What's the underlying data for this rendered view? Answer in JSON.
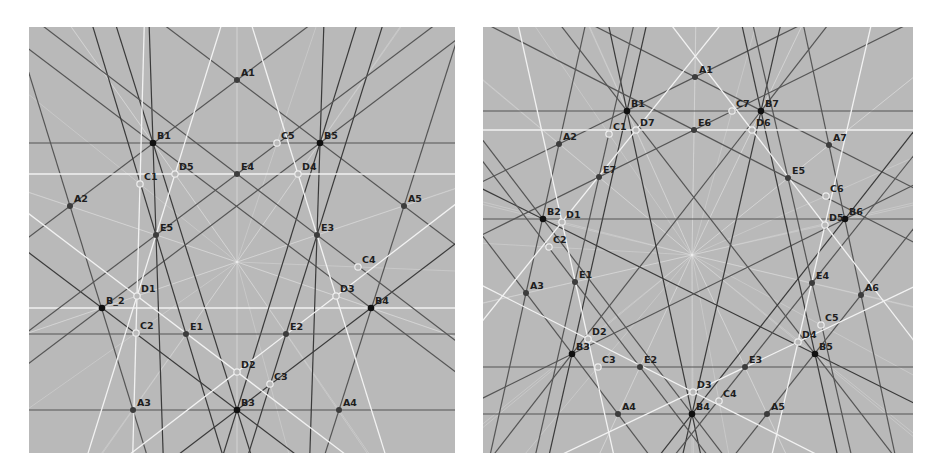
{
  "colors": {
    "background": "#b9b9b9",
    "dark_line": "#3a3a3a",
    "mid_line": "#555555",
    "white_line": "#f2f2f2",
    "filled_point": "#3c3c3c",
    "black_point": "#101010",
    "hollow_point_stroke": "#eeeeee",
    "label": "#1e1e1e"
  },
  "left_diagram": {
    "name": "pentagon-construction",
    "origin": [
      29,
      27
    ],
    "center": [
      237,
      262
    ],
    "points": [
      {
        "label": "A1",
        "x": 237,
        "y": 80,
        "style": "filled"
      },
      {
        "label": "A2",
        "x": 70,
        "y": 206,
        "style": "filled"
      },
      {
        "label": "A3",
        "x": 133,
        "y": 410,
        "style": "filled"
      },
      {
        "label": "A4",
        "x": 339,
        "y": 410,
        "style": "filled"
      },
      {
        "label": "A5",
        "x": 404,
        "y": 206,
        "style": "filled"
      },
      {
        "label": "B1",
        "x": 153,
        "y": 143,
        "style": "black"
      },
      {
        "label": "B_2",
        "x": 102,
        "y": 308,
        "style": "black"
      },
      {
        "label": "B3",
        "x": 237,
        "y": 410,
        "style": "black"
      },
      {
        "label": "B4",
        "x": 371,
        "y": 308,
        "style": "black"
      },
      {
        "label": "B5",
        "x": 320,
        "y": 143,
        "style": "black"
      },
      {
        "label": "C1",
        "x": 140,
        "y": 184,
        "style": "hollow"
      },
      {
        "label": "C2",
        "x": 136,
        "y": 333,
        "style": "hollow"
      },
      {
        "label": "C3",
        "x": 270,
        "y": 384,
        "style": "hollow"
      },
      {
        "label": "C4",
        "x": 358,
        "y": 267,
        "style": "hollow"
      },
      {
        "label": "C5",
        "x": 277,
        "y": 143,
        "style": "hollow"
      },
      {
        "label": "D1",
        "x": 137,
        "y": 296,
        "style": "hollow"
      },
      {
        "label": "D2",
        "x": 237,
        "y": 372,
        "style": "hollow"
      },
      {
        "label": "D3",
        "x": 336,
        "y": 296,
        "style": "hollow"
      },
      {
        "label": "D4",
        "x": 298,
        "y": 174,
        "style": "hollow"
      },
      {
        "label": "D5",
        "x": 175,
        "y": 174,
        "style": "hollow"
      },
      {
        "label": "E1",
        "x": 186,
        "y": 334,
        "style": "filled"
      },
      {
        "label": "E2",
        "x": 286,
        "y": 334,
        "style": "filled"
      },
      {
        "label": "E3",
        "x": 317,
        "y": 235,
        "style": "filled"
      },
      {
        "label": "E4",
        "x": 237,
        "y": 174,
        "style": "filled"
      },
      {
        "label": "E5",
        "x": 156,
        "y": 235,
        "style": "filled"
      }
    ],
    "lines": [
      {
        "through": [
          "A1",
          "A2"
        ],
        "kind": "mid"
      },
      {
        "through": [
          "A2",
          "A3"
        ],
        "kind": "mid"
      },
      {
        "through": [
          "A3",
          "A4"
        ],
        "kind": "mid"
      },
      {
        "through": [
          "A4",
          "A5"
        ],
        "kind": "mid"
      },
      {
        "through": [
          "A5",
          "A1"
        ],
        "kind": "mid"
      },
      {
        "through": [
          "B1",
          "B5"
        ],
        "kind": "mid"
      },
      {
        "through": [
          "B1",
          "B3"
        ],
        "kind": "dark"
      },
      {
        "through": [
          "B_2",
          "B4"
        ],
        "kind": "white"
      },
      {
        "through": [
          "B3",
          "B5"
        ],
        "kind": "dark"
      },
      {
        "through": [
          "B_2",
          "B3"
        ],
        "kind": "dark"
      },
      {
        "through": [
          "B4",
          "B3"
        ],
        "kind": "dark"
      },
      {
        "through": [
          "B1",
          "B4"
        ],
        "kind": "mid"
      },
      {
        "through": [
          "B5",
          "B_2"
        ],
        "kind": "mid"
      },
      {
        "through": [
          "B1",
          "E5"
        ],
        "kind": "dark"
      },
      {
        "through": [
          "B5",
          "E3"
        ],
        "kind": "dark"
      },
      {
        "through": [
          "E5",
          "E1"
        ],
        "kind": "dark"
      },
      {
        "through": [
          "E3",
          "E2"
        ],
        "kind": "dark"
      },
      {
        "through": [
          "E1",
          "E2"
        ],
        "kind": "mid"
      },
      {
        "through": [
          "E4",
          "E5"
        ],
        "kind": "mid"
      },
      {
        "through": [
          "E4",
          "E3"
        ],
        "kind": "mid"
      },
      {
        "through": [
          "D5",
          "D4"
        ],
        "kind": "white"
      },
      {
        "through": [
          "D5",
          "D1"
        ],
        "kind": "white"
      },
      {
        "through": [
          "D4",
          "D3"
        ],
        "kind": "white"
      },
      {
        "through": [
          "D1",
          "D2"
        ],
        "kind": "white"
      },
      {
        "through": [
          "D3",
          "D2"
        ],
        "kind": "white"
      },
      {
        "through": [
          "C1",
          "C2"
        ],
        "kind": "white"
      }
    ]
  },
  "right_diagram": {
    "name": "heptagon-construction",
    "origin": [
      483,
      27
    ],
    "center": [
      692,
      255
    ],
    "points": [
      {
        "label": "A1",
        "x": 695,
        "y": 77,
        "style": "filled"
      },
      {
        "label": "A2",
        "x": 559,
        "y": 144,
        "style": "filled"
      },
      {
        "label": "A3",
        "x": 526,
        "y": 293,
        "style": "filled"
      },
      {
        "label": "A4",
        "x": 618,
        "y": 414,
        "style": "filled"
      },
      {
        "label": "A5",
        "x": 767,
        "y": 414,
        "style": "filled"
      },
      {
        "label": "A6",
        "x": 861,
        "y": 295,
        "style": "filled"
      },
      {
        "label": "A7",
        "x": 829,
        "y": 145,
        "style": "filled"
      },
      {
        "label": "B1",
        "x": 627,
        "y": 111,
        "style": "black"
      },
      {
        "label": "B2",
        "x": 543,
        "y": 219,
        "style": "black"
      },
      {
        "label": "B3",
        "x": 572,
        "y": 354,
        "style": "black"
      },
      {
        "label": "B4",
        "x": 692,
        "y": 414,
        "style": "black"
      },
      {
        "label": "B5",
        "x": 815,
        "y": 354,
        "style": "black"
      },
      {
        "label": "B6",
        "x": 845,
        "y": 219,
        "style": "black"
      },
      {
        "label": "B7",
        "x": 761,
        "y": 111,
        "style": "black"
      },
      {
        "label": "C1",
        "x": 609,
        "y": 134,
        "style": "hollow"
      },
      {
        "label": "C2",
        "x": 549,
        "y": 247,
        "style": "hollow"
      },
      {
        "label": "C3",
        "x": 598,
        "y": 367,
        "style": "hollow"
      },
      {
        "label": "C4",
        "x": 719,
        "y": 401,
        "style": "hollow"
      },
      {
        "label": "C5",
        "x": 821,
        "y": 325,
        "style": "hollow"
      },
      {
        "label": "C6",
        "x": 826,
        "y": 196,
        "style": "hollow"
      },
      {
        "label": "C7",
        "x": 732,
        "y": 111,
        "style": "hollow"
      },
      {
        "label": "D1",
        "x": 562,
        "y": 222,
        "style": "hollow"
      },
      {
        "label": "D2",
        "x": 588,
        "y": 339,
        "style": "hollow"
      },
      {
        "label": "D3",
        "x": 693,
        "y": 392,
        "style": "hollow"
      },
      {
        "label": "D4",
        "x": 798,
        "y": 342,
        "style": "hollow"
      },
      {
        "label": "D5",
        "x": 825,
        "y": 225,
        "style": "hollow"
      },
      {
        "label": "D6",
        "x": 752,
        "y": 130,
        "style": "hollow"
      },
      {
        "label": "D7",
        "x": 636,
        "y": 130,
        "style": "hollow"
      },
      {
        "label": "E1",
        "x": 575,
        "y": 282,
        "style": "filled"
      },
      {
        "label": "E2",
        "x": 640,
        "y": 367,
        "style": "filled"
      },
      {
        "label": "E3",
        "x": 745,
        "y": 367,
        "style": "filled"
      },
      {
        "label": "E4",
        "x": 812,
        "y": 283,
        "style": "filled"
      },
      {
        "label": "E5",
        "x": 788,
        "y": 178,
        "style": "filled"
      },
      {
        "label": "E6",
        "x": 694,
        "y": 130,
        "style": "filled"
      },
      {
        "label": "E7",
        "x": 599,
        "y": 177,
        "style": "filled"
      }
    ],
    "lines": [
      {
        "through": [
          "A1",
          "A2"
        ],
        "kind": "mid"
      },
      {
        "through": [
          "A2",
          "A3"
        ],
        "kind": "mid"
      },
      {
        "through": [
          "A3",
          "A4"
        ],
        "kind": "mid"
      },
      {
        "through": [
          "A4",
          "A5"
        ],
        "kind": "mid"
      },
      {
        "through": [
          "A5",
          "A6"
        ],
        "kind": "mid"
      },
      {
        "through": [
          "A6",
          "A7"
        ],
        "kind": "mid"
      },
      {
        "through": [
          "A7",
          "A1"
        ],
        "kind": "mid"
      },
      {
        "through": [
          "B1",
          "B7"
        ],
        "kind": "mid"
      },
      {
        "through": [
          "B1",
          "B3"
        ],
        "kind": "dark"
      },
      {
        "through": [
          "B2",
          "B5"
        ],
        "kind": "dark"
      },
      {
        "through": [
          "B3",
          "B6"
        ],
        "kind": "mid"
      },
      {
        "through": [
          "B4",
          "B7"
        ],
        "kind": "dark"
      },
      {
        "through": [
          "B5",
          "B1"
        ],
        "kind": "mid"
      },
      {
        "through": [
          "B6",
          "B2"
        ],
        "kind": "mid"
      },
      {
        "through": [
          "B7",
          "B3"
        ],
        "kind": "mid"
      },
      {
        "through": [
          "B4",
          "B1"
        ],
        "kind": "dark"
      },
      {
        "through": [
          "B6",
          "B4"
        ],
        "kind": "dark"
      },
      {
        "through": [
          "B2",
          "B4"
        ],
        "kind": "mid"
      },
      {
        "through": [
          "B5",
          "B7"
        ],
        "kind": "dark"
      },
      {
        "through": [
          "E1",
          "E2"
        ],
        "kind": "mid"
      },
      {
        "through": [
          "E2",
          "E3"
        ],
        "kind": "mid"
      },
      {
        "through": [
          "E3",
          "E4"
        ],
        "kind": "mid"
      },
      {
        "through": [
          "E4",
          "E5"
        ],
        "kind": "mid"
      },
      {
        "through": [
          "E5",
          "E6"
        ],
        "kind": "mid"
      },
      {
        "through": [
          "E6",
          "E7"
        ],
        "kind": "mid"
      },
      {
        "through": [
          "E7",
          "E1"
        ],
        "kind": "mid"
      },
      {
        "through": [
          "D7",
          "D6"
        ],
        "kind": "white"
      },
      {
        "through": [
          "D1",
          "D2"
        ],
        "kind": "white"
      },
      {
        "through": [
          "D2",
          "D3"
        ],
        "kind": "white"
      },
      {
        "through": [
          "D3",
          "D4"
        ],
        "kind": "white"
      },
      {
        "through": [
          "D4",
          "D5"
        ],
        "kind": "white"
      },
      {
        "through": [
          "D5",
          "D6"
        ],
        "kind": "white"
      },
      {
        "through": [
          "D7",
          "D1"
        ],
        "kind": "white"
      }
    ]
  }
}
